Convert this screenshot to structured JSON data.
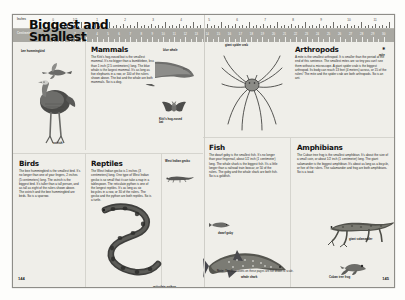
{
  "document": {
    "title": "Biggest and Smallest",
    "ruler": {
      "inches_label": "Inches",
      "centimeters_label": "Centimeters",
      "inches_ticks": [
        "0",
        "1/2",
        "1",
        "2",
        "3",
        "4",
        "5",
        "6",
        "7",
        "8",
        "9",
        "10",
        "11",
        "12"
      ],
      "centimeter_ticks": [
        "1",
        "2",
        "3",
        "4",
        "5",
        "6",
        "7",
        "8",
        "9",
        "10",
        "11",
        "12",
        "13",
        "14",
        "15",
        "16",
        "17",
        "18",
        "19",
        "20",
        "21",
        "22",
        "23",
        "24",
        "25",
        "26",
        "27",
        "28",
        "29",
        "30"
      ]
    },
    "sections": [
      {
        "id": "mammals",
        "heading": "Mammals",
        "body": "The Kitti's hog-nosed bat is the smallest mammal. It's no bigger than a bumblebee, less than 1 inch (2.5 centimeters) long. The blue whale is the largest mammal. It's as long as five elephants in a row, or 100 of the rulers shown above. The bat and the whale are both mammals. So is a dog."
      },
      {
        "id": "birds",
        "heading": "Birds",
        "body": "The bee hummingbird is the smallest bird. It's no longer than one of your fingers, 2 inches (5 centimeters) long. The ostrich is the biggest bird. It's taller than a tall person, and as tall as eight of the rulers shown above. The ostrich and the bee hummingbird are birds. So is a sparrow."
      },
      {
        "id": "reptiles",
        "heading": "Reptiles",
        "body": "The West Indian gecko is 1 inches (3 centimeters) long. One type of West Indian gecko is so small that it can take a nap in a tablespoon. The reticulate python is one of the longest reptiles. It's as long as six bicycles in a row, or 30 of the rulers. The gecko and the python are both reptiles. So is a turtle."
      },
      {
        "id": "fish",
        "heading": "Fish",
        "body": "The dwarf goby is the smallest fish. It's no longer than your fingernail, about 1/2 inch (1 centimeter) long. The whale shark is the biggest fish. It's a little longer than a railroad train boxcar, or 50 of the rulers. The goby and the whale shark are both fish. So is a goldfish."
      },
      {
        "id": "amphibians",
        "heading": "Amphibians",
        "body": "The Cuban tree frog is the smallest amphibian. It's about the size of a small coin, or about 1/2 inch (1 centimeter) long. The giant salamander is the biggest amphibian. It's about as long as a bicycle, or five of the rulers. The salamander and frog are both amphibians. So is a toad."
      },
      {
        "id": "arthropods",
        "heading": "Arthropods",
        "body": "A mite is the smallest arthropod. It is smaller than the period at the end of this sentence. The smallest mites are so tiny you can't see them without a microscope. A giant spider crab is the biggest arthropod. Its body can reach 13 feet (4 meters) across, or 15 of the rulers! The mite and the spider crab are both arthropods. So is an ant."
      }
    ],
    "captions": {
      "blue_whale": "blue whale",
      "bee_hummingbird": "bee hummingbird",
      "ostrich": "ostrich",
      "kittis_bat": "Kitti's hog-nosed bat",
      "west_indian_gecko": "West Indian gecko",
      "reticulate_python": "reticulate python",
      "giant_spider_crab": "giant spider crab",
      "mite": "mite",
      "dwarf_goby": "dwarf goby",
      "whale_shark": "whale shark",
      "giant_salamander": "giant salamander",
      "cuban_tree_frog": "Cuban tree frog"
    },
    "note": {
      "label": "Note:",
      "text": "The illustrations on these pages are not drawn to scale."
    },
    "folios": {
      "left": "144",
      "right": "145"
    },
    "colors": {
      "paper": "#efeee9",
      "ruler_cm_band": "#a9a8a2",
      "ink": "#1a1a1a"
    }
  }
}
